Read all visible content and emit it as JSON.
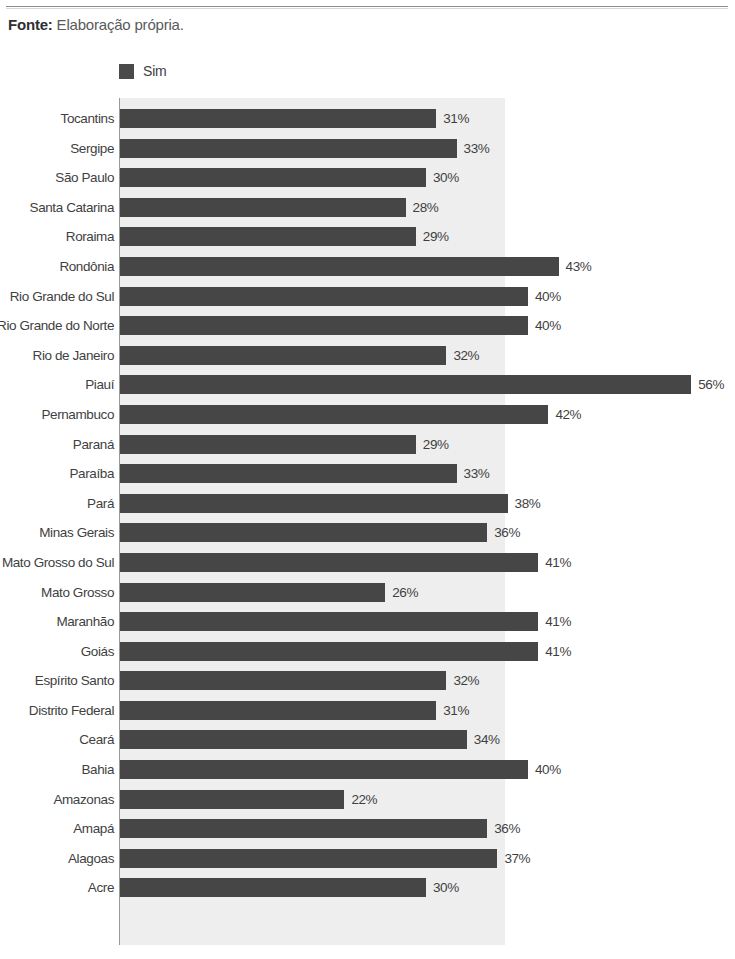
{
  "source": {
    "label": "Fonte:",
    "text": " Elaboração própria."
  },
  "legend": {
    "items": [
      {
        "label": "Sim",
        "color": "#464646",
        "swatch_icon": "legend-swatch-icon"
      }
    ]
  },
  "chart_data": {
    "type": "bar",
    "orientation": "horizontal",
    "title": "",
    "subtitle": "",
    "xlabel": "",
    "ylabel": "",
    "legend": [
      "Sim"
    ],
    "legend_position": "top-left",
    "grid": false,
    "xlim": [
      0,
      60
    ],
    "value_suffix": "%",
    "plot_background": "#eeeeee",
    "bar_color": "#464646",
    "categories": [
      "Tocantins",
      "Sergipe",
      "São Paulo",
      "Santa Catarina",
      "Roraima",
      "Rondônia",
      "Rio Grande do Sul",
      "Rio Grande do Norte",
      "Rio de Janeiro",
      "Piauí",
      "Pernambuco",
      "Paraná",
      "Paraíba",
      "Pará",
      "Minas Gerais",
      "Mato Grosso do Sul",
      "Mato Grosso",
      "Maranhão",
      "Goiás",
      "Espírito Santo",
      "Distrito Federal",
      "Ceará",
      "Bahia",
      "Amazonas",
      "Amapá",
      "Alagoas",
      "Acre"
    ],
    "values": [
      31,
      33,
      30,
      28,
      29,
      43,
      40,
      40,
      32,
      56,
      42,
      29,
      33,
      38,
      36,
      41,
      26,
      41,
      41,
      32,
      31,
      34,
      40,
      22,
      36,
      37,
      30
    ],
    "labels": [
      "31%",
      "33%",
      "30%",
      "28%",
      "29%",
      "43%",
      "40%",
      "40%",
      "32%",
      "56%",
      "42%",
      "29%",
      "33%",
      "38%",
      "36%",
      "41%",
      "26%",
      "41%",
      "41%",
      "32%",
      "31%",
      "34%",
      "40%",
      "22%",
      "36%",
      "37%",
      "30%"
    ],
    "series": [
      {
        "name": "Sim",
        "values": [
          31,
          33,
          30,
          28,
          29,
          43,
          40,
          40,
          32,
          56,
          42,
          29,
          33,
          38,
          36,
          41,
          26,
          41,
          41,
          32,
          31,
          34,
          40,
          22,
          36,
          37,
          30
        ]
      }
    ]
  }
}
